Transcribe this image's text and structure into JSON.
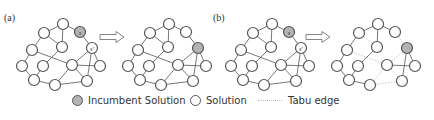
{
  "panels": [
    {
      "label": "(a)",
      "x": 4,
      "y": 20
    },
    {
      "label": "(b)",
      "x": 213,
      "y": 20
    }
  ],
  "graphs": [
    {
      "id": "a-before",
      "offset": [
        0,
        0
      ],
      "nodes": [
        {
          "id": 1,
          "x": 63,
          "y": 24,
          "type": "solution"
        },
        {
          "id": 2,
          "x": 80,
          "y": 32,
          "type": "incumbent",
          "text": "s"
        },
        {
          "id": 3,
          "x": 44,
          "y": 33,
          "type": "solution"
        },
        {
          "id": 4,
          "x": 62,
          "y": 47,
          "type": "solution"
        },
        {
          "id": 5,
          "x": 92,
          "y": 48,
          "type": "solution",
          "text": "s'"
        },
        {
          "id": 6,
          "x": 32,
          "y": 50,
          "type": "solution"
        },
        {
          "id": 7,
          "x": 22,
          "y": 66,
          "type": "solution"
        },
        {
          "id": 8,
          "x": 43,
          "y": 66,
          "type": "solution"
        },
        {
          "id": 9,
          "x": 72,
          "y": 65,
          "type": "solution"
        },
        {
          "id": 10,
          "x": 100,
          "y": 66,
          "type": "solution"
        },
        {
          "id": 11,
          "x": 34,
          "y": 80,
          "type": "solution"
        },
        {
          "id": 12,
          "x": 55,
          "y": 85,
          "type": "solution"
        },
        {
          "id": 13,
          "x": 87,
          "y": 81,
          "type": "solution"
        }
      ],
      "edges": [
        [
          1,
          3
        ],
        [
          1,
          2
        ],
        [
          1,
          4
        ],
        [
          2,
          5
        ],
        [
          3,
          6
        ],
        [
          3,
          4
        ],
        [
          6,
          7
        ],
        [
          6,
          9
        ],
        [
          7,
          11
        ],
        [
          8,
          11
        ],
        [
          8,
          4
        ],
        [
          9,
          5
        ],
        [
          9,
          10
        ],
        [
          9,
          13
        ],
        [
          5,
          13
        ],
        [
          5,
          10
        ],
        [
          11,
          12
        ],
        [
          12,
          13
        ],
        [
          12,
          9
        ]
      ],
      "tabu_edges": []
    },
    {
      "id": "a-after",
      "offset": [
        106,
        0
      ],
      "nodes": [
        {
          "id": 1,
          "x": 63,
          "y": 24,
          "type": "solution"
        },
        {
          "id": 2,
          "x": 80,
          "y": 32,
          "type": "solution"
        },
        {
          "id": 3,
          "x": 44,
          "y": 33,
          "type": "solution"
        },
        {
          "id": 4,
          "x": 62,
          "y": 47,
          "type": "solution"
        },
        {
          "id": 5,
          "x": 92,
          "y": 48,
          "type": "incumbent"
        },
        {
          "id": 6,
          "x": 32,
          "y": 50,
          "type": "solution"
        },
        {
          "id": 7,
          "x": 22,
          "y": 66,
          "type": "solution"
        },
        {
          "id": 8,
          "x": 43,
          "y": 66,
          "type": "solution"
        },
        {
          "id": 9,
          "x": 72,
          "y": 65,
          "type": "solution"
        },
        {
          "id": 10,
          "x": 100,
          "y": 66,
          "type": "solution"
        },
        {
          "id": 11,
          "x": 34,
          "y": 80,
          "type": "solution"
        },
        {
          "id": 12,
          "x": 55,
          "y": 85,
          "type": "solution"
        },
        {
          "id": 13,
          "x": 87,
          "y": 81,
          "type": "solution"
        }
      ],
      "edges": [
        [
          1,
          3
        ],
        [
          1,
          2
        ],
        [
          1,
          4
        ],
        [
          2,
          5
        ],
        [
          3,
          6
        ],
        [
          3,
          4
        ],
        [
          6,
          7
        ],
        [
          6,
          9
        ],
        [
          7,
          11
        ],
        [
          8,
          11
        ],
        [
          8,
          4
        ],
        [
          9,
          5
        ],
        [
          9,
          10
        ],
        [
          9,
          13
        ],
        [
          5,
          13
        ],
        [
          5,
          10
        ],
        [
          11,
          12
        ],
        [
          12,
          13
        ],
        [
          12,
          9
        ]
      ],
      "tabu_edges": []
    },
    {
      "id": "b-before",
      "offset": [
        209,
        0
      ],
      "nodes": [
        {
          "id": 1,
          "x": 63,
          "y": 24,
          "type": "solution"
        },
        {
          "id": 2,
          "x": 80,
          "y": 32,
          "type": "incumbent",
          "text": "s"
        },
        {
          "id": 3,
          "x": 44,
          "y": 33,
          "type": "solution"
        },
        {
          "id": 4,
          "x": 62,
          "y": 47,
          "type": "solution"
        },
        {
          "id": 5,
          "x": 92,
          "y": 48,
          "type": "solution",
          "text": "s'"
        },
        {
          "id": 6,
          "x": 32,
          "y": 50,
          "type": "solution"
        },
        {
          "id": 7,
          "x": 22,
          "y": 66,
          "type": "solution"
        },
        {
          "id": 8,
          "x": 43,
          "y": 66,
          "type": "solution"
        },
        {
          "id": 9,
          "x": 72,
          "y": 65,
          "type": "solution"
        },
        {
          "id": 10,
          "x": 100,
          "y": 66,
          "type": "solution"
        },
        {
          "id": 11,
          "x": 34,
          "y": 80,
          "type": "solution"
        },
        {
          "id": 12,
          "x": 55,
          "y": 85,
          "type": "solution"
        },
        {
          "id": 13,
          "x": 87,
          "y": 81,
          "type": "solution"
        }
      ],
      "edges": [
        [
          1,
          3
        ],
        [
          1,
          2
        ],
        [
          1,
          4
        ],
        [
          2,
          5
        ],
        [
          3,
          6
        ],
        [
          3,
          4
        ],
        [
          6,
          7
        ],
        [
          6,
          9
        ],
        [
          7,
          11
        ],
        [
          8,
          11
        ],
        [
          8,
          4
        ],
        [
          9,
          5
        ],
        [
          9,
          10
        ],
        [
          9,
          13
        ],
        [
          5,
          13
        ],
        [
          5,
          10
        ],
        [
          11,
          12
        ],
        [
          12,
          13
        ],
        [
          12,
          9
        ]
      ],
      "tabu_edges": []
    },
    {
      "id": "b-after",
      "offset": [
        315,
        0
      ],
      "nodes": [
        {
          "id": 1,
          "x": 63,
          "y": 24,
          "type": "solution"
        },
        {
          "id": 2,
          "x": 80,
          "y": 32,
          "type": "solution"
        },
        {
          "id": 3,
          "x": 44,
          "y": 33,
          "type": "solution"
        },
        {
          "id": 4,
          "x": 62,
          "y": 47,
          "type": "solution"
        },
        {
          "id": 5,
          "x": 92,
          "y": 48,
          "type": "incumbent"
        },
        {
          "id": 6,
          "x": 32,
          "y": 50,
          "type": "solution"
        },
        {
          "id": 7,
          "x": 22,
          "y": 66,
          "type": "solution"
        },
        {
          "id": 8,
          "x": 43,
          "y": 66,
          "type": "solution"
        },
        {
          "id": 9,
          "x": 72,
          "y": 65,
          "type": "solution"
        },
        {
          "id": 10,
          "x": 100,
          "y": 66,
          "type": "solution"
        },
        {
          "id": 11,
          "x": 34,
          "y": 80,
          "type": "solution"
        },
        {
          "id": 12,
          "x": 55,
          "y": 85,
          "type": "solution"
        },
        {
          "id": 13,
          "x": 87,
          "y": 81,
          "type": "solution"
        }
      ],
      "edges": [
        [
          1,
          3
        ],
        [
          1,
          2
        ],
        [
          1,
          4
        ],
        [
          3,
          6
        ],
        [
          6,
          7
        ],
        [
          7,
          11
        ],
        [
          8,
          11
        ],
        [
          8,
          4
        ],
        [
          9,
          10
        ],
        [
          5,
          13
        ],
        [
          5,
          10
        ],
        [
          11,
          12
        ]
      ],
      "tabu_edges": [
        [
          2,
          5
        ],
        [
          3,
          4
        ],
        [
          6,
          9
        ],
        [
          9,
          5
        ],
        [
          9,
          13
        ],
        [
          12,
          13
        ],
        [
          12,
          9
        ]
      ]
    }
  ],
  "arrows": [
    {
      "x": 100,
      "y": 37
    },
    {
      "x": 306,
      "y": 37
    }
  ],
  "legend": {
    "items": [
      {
        "type": "incumbent",
        "label": "Incumbent Solution",
        "x": 72
      },
      {
        "type": "solution",
        "label": "Solution",
        "x": 190
      },
      {
        "type": "tabu",
        "label": "Tabu edge",
        "x": 258
      }
    ]
  },
  "colors": {
    "incumbent_fill": "#b3b3b3",
    "node_stroke": "#555555",
    "edge": "#555555",
    "tabu_edge": "#c8c8c8",
    "arrow_stroke": "#777777"
  }
}
